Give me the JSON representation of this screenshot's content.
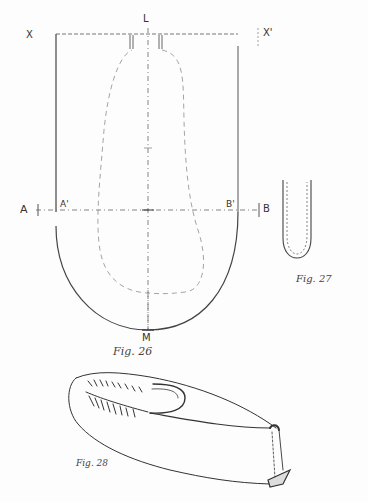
{
  "figures": {
    "fig26": {
      "caption": "Fig. 26",
      "labels": {
        "top_center": "L",
        "top_left": "X",
        "top_right": "X'",
        "left_outer": "A",
        "left_inner": "A'",
        "right_inner": "B'",
        "right_outer": "B",
        "bottom_center": "M"
      }
    },
    "fig27": {
      "caption": "Fig. 27"
    },
    "fig28": {
      "caption": "Fig. 28"
    }
  },
  "colors": {
    "ink": "#333333",
    "light_ink": "#888888",
    "paper": "#fdfdfd"
  }
}
